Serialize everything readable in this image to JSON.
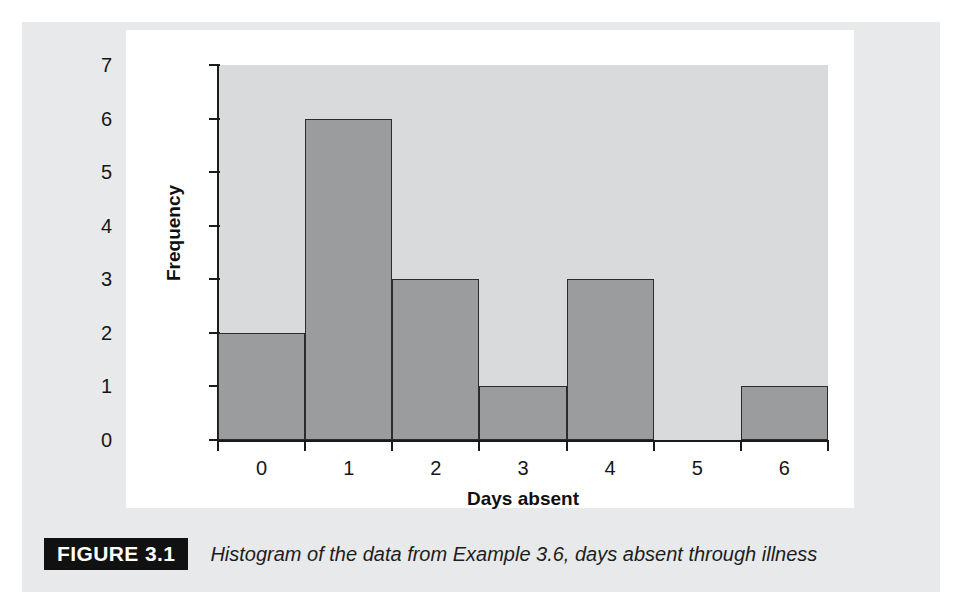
{
  "caption": {
    "figure_tag": "FIGURE 3.1",
    "text": "Histogram of the data from Example 3.6, days absent through illness"
  },
  "colors": {
    "page_panel": "#e8e9ea",
    "card": "#ffffff",
    "plot_background": "#d9dadb",
    "bar_fill": "#9b9c9d",
    "bar_stroke": "#2b2b2b",
    "axis": "#1b1b1b",
    "figure_tag_background": "#111111",
    "figure_tag_text": "#ffffff"
  },
  "chart_data": {
    "type": "bar",
    "title": "",
    "xlabel": "Days absent",
    "ylabel": "Frequency",
    "categories": [
      "0",
      "1",
      "2",
      "3",
      "4",
      "5",
      "6"
    ],
    "values": [
      2,
      6,
      3,
      1,
      3,
      0,
      1
    ],
    "xtick_labels": [
      "0",
      "1",
      "2",
      "3",
      "4",
      "5",
      "6"
    ],
    "ytick_labels": [
      "0",
      "1",
      "2",
      "3",
      "4",
      "5",
      "6",
      "7"
    ],
    "yticks": [
      0,
      1,
      2,
      3,
      4,
      5,
      6,
      7
    ],
    "ylim": [
      0,
      7
    ],
    "bin_edges": [
      -0.5,
      0.5,
      1.5,
      2.5,
      3.5,
      4.5,
      5.5,
      6.5
    ],
    "grid": false,
    "legend": false,
    "legend_position": "none"
  }
}
